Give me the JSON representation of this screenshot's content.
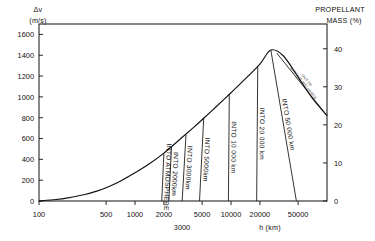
{
  "chart_data": {
    "type": "line",
    "title": "",
    "xlabel": "h (km)",
    "ylabel_left": "Δv (m/s)",
    "ylabel_right": "PROPELLANT MASS (%)",
    "xscale": "log",
    "xlim": [
      100,
      100000
    ],
    "ylim_left": [
      0,
      1700
    ],
    "ylim_right": [
      0,
      46.5
    ],
    "grid": false,
    "legend": "none",
    "x_ticks": [
      100,
      500,
      1000,
      2000,
      5000,
      10000,
      20000,
      50000
    ],
    "x_tick_labels": [
      "100",
      "500",
      "1000",
      "2000",
      "5000",
      "10000",
      "20000",
      "50000"
    ],
    "x_extra_tick_label": "3000",
    "y_ticks_left": [
      0,
      200,
      400,
      600,
      800,
      1000,
      1200,
      1400,
      1600
    ],
    "y_tick_labels_left": [
      "0",
      "200",
      "400",
      "600",
      "800",
      "1000",
      "1200",
      "1400",
      "1600"
    ],
    "y_ticks_right": [
      0,
      10,
      20,
      30,
      40
    ],
    "y_tick_labels_right": [
      "0",
      "10",
      "20",
      "30",
      "40"
    ],
    "series": [
      {
        "name": "envelope",
        "comment": "delta-v envelope vs altitude h (km)",
        "x": [
          100,
          150,
          200,
          300,
          400,
          500,
          700,
          1000,
          1400,
          2000,
          3000,
          4000,
          5000,
          7000,
          10000,
          14000,
          20000,
          26000,
          35000,
          50000,
          70000,
          100000
        ],
        "y": [
          0,
          14,
          30,
          62,
          95,
          128,
          190,
          272,
          355,
          460,
          600,
          700,
          780,
          905,
          1040,
          1170,
          1315,
          1450,
          1395,
          1190,
          990,
          820
        ]
      }
    ],
    "radial_lines": [
      {
        "label": "INTO ATMOSPHERE",
        "h_top": 2000,
        "dv_top": 460,
        "h_base": 1900
      },
      {
        "label": "INTO 2000km",
        "h_top": 2400,
        "dv_top": 520,
        "h_base": 2250
      },
      {
        "label": "INTO 3000km",
        "h_top": 3400,
        "dv_top": 640,
        "h_base": 3100
      },
      {
        "label": "INTO 5000km",
        "h_top": 5200,
        "dv_top": 800,
        "h_base": 4700
      },
      {
        "label": "INTO 10 000 km",
        "h_top": 9600,
        "dv_top": 1030,
        "h_base": 9400
      },
      {
        "label": "INTO 20 000 km",
        "h_top": 19000,
        "dv_top": 1290,
        "h_base": 18500
      },
      {
        "label": "INTO 50 000 km",
        "h_top": 26000,
        "dv_top": 1450,
        "h_base": 48000
      }
    ],
    "annotations": [
      {
        "text": "OUT OF EARTH'S INFLUENCE",
        "h_start": 30000,
        "dv_start": 1420,
        "h_end": 100000,
        "dv_end": 820
      }
    ]
  }
}
